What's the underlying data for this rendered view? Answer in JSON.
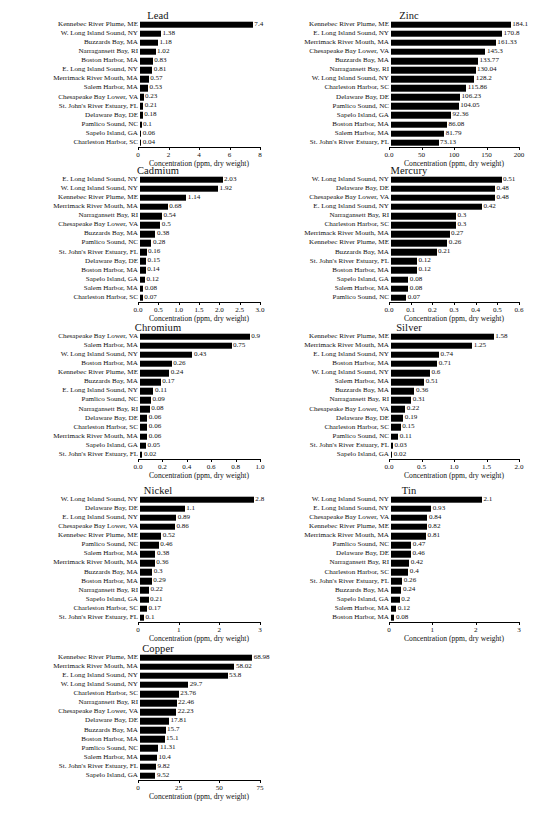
{
  "figure": {
    "axis_label": "Concentration (ppm, dry weight)",
    "bar_color": "#000000",
    "background": "#ffffff"
  },
  "chart_data": [
    {
      "id": "lead",
      "type": "bar",
      "orientation": "horizontal",
      "title": "Lead",
      "xlabel": "Concentration (ppm, dry weight)",
      "ylabel": "",
      "xlim": [
        0,
        8
      ],
      "ticks": [
        0,
        2,
        4,
        6,
        8
      ],
      "tick_labels": [
        "0",
        "2",
        "4",
        "6",
        "8"
      ],
      "grid": false,
      "legend": "none",
      "categories": [
        "Kennebec River Plume, ME",
        "W. Long Island Sound, NY",
        "Buzzards Bay, MA",
        "Narragansett Bay, RI",
        "Boston Harbor, MA",
        "E. Long Island Sound, NY",
        "Merrimack River Mouth, MA",
        "Salem Harbor, MA",
        "Chesapeake Bay Lower, VA",
        "St. John's River Estuary, FL",
        "Delaware Bay, DE",
        "Pamlico Sound, NC",
        "Sapelo Island, GA",
        "Charleston Harbor, SC"
      ],
      "values": [
        7.4,
        1.38,
        1.18,
        1.02,
        0.83,
        0.81,
        0.57,
        0.53,
        0.23,
        0.21,
        0.18,
        0.1,
        0.06,
        0.04
      ],
      "value_labels": [
        "7.4",
        "1.38",
        "1.18",
        "1.02",
        "0.83",
        "0.81",
        "0.57",
        "0.53",
        "0.23",
        "0.21",
        "0.18",
        "0.1",
        "0.06",
        "0.04"
      ]
    },
    {
      "id": "zinc",
      "type": "bar",
      "orientation": "horizontal",
      "title": "Zinc",
      "xlabel": "Concentration (ppm, dry weight)",
      "ylabel": "",
      "xlim": [
        0,
        200
      ],
      "ticks": [
        0,
        50,
        100,
        150,
        200
      ],
      "tick_labels": [
        "0.0",
        "50",
        "100",
        "150",
        "200"
      ],
      "grid": false,
      "legend": "none",
      "categories": [
        "Kennebec River Plume, ME",
        "E. Long Island Sound, NY",
        "Merrimack River Mouth, MA",
        "Chesapeake Bay Lower, VA",
        "Buzzards Bay, MA",
        "Narragansett Bay, RI",
        "W. Long Island Sound, NY",
        "Charleston Harbor, SC",
        "Delaware Bay, DE",
        "Pamlico Sound, NC",
        "Sapelo Island, GA",
        "Boston Harbor, MA",
        "Salem Harbor, MA",
        "St. John's River Estuary, FL"
      ],
      "values": [
        184.1,
        170.8,
        161.33,
        145.3,
        133.77,
        130.04,
        128.2,
        115.86,
        106.23,
        104.05,
        92.36,
        86.08,
        81.79,
        73.13
      ],
      "value_labels": [
        "184.1",
        "170.8",
        "161.33",
        "145.3",
        "133.77",
        "130.04",
        "128.2",
        "115.86",
        "106.23",
        "104.05",
        "92.36",
        "86.08",
        "81.79",
        "73.13"
      ]
    },
    {
      "id": "cadmium",
      "type": "bar",
      "orientation": "horizontal",
      "title": "Cadmium",
      "xlabel": "Concentration (ppm, dry weight)",
      "ylabel": "",
      "xlim": [
        0,
        3.0
      ],
      "ticks": [
        0,
        0.5,
        1.0,
        1.5,
        2.0,
        2.5,
        3.0
      ],
      "tick_labels": [
        "0.0",
        "0.5",
        "1.0",
        "1.5",
        "2.0",
        "2.5",
        "3.0"
      ],
      "grid": false,
      "legend": "none",
      "categories": [
        "E. Long Island Sound, NY",
        "W. Long Island Sound, NY",
        "Kennebec River Plume, ME",
        "Merrimack River Mouth, MA",
        "Narragansett Bay, RI",
        "Chesapeake Bay Lower, VA",
        "Buzzards Bay, MA",
        "Pamlico Sound, NC",
        "St. John's River Estuary, FL",
        "Delaware Bay, DE",
        "Boston Harbor, MA",
        "Sapelo Island, GA",
        "Salem Harbor, MA",
        "Charleston Harbor, SC"
      ],
      "values": [
        2.03,
        1.92,
        1.14,
        0.68,
        0.54,
        0.5,
        0.38,
        0.28,
        0.16,
        0.15,
        0.14,
        0.12,
        0.08,
        0.07
      ],
      "value_labels": [
        "2.03",
        "1.92",
        "1.14",
        "0.68",
        "0.54",
        "0.5",
        "0.38",
        "0.28",
        "0.16",
        "0.15",
        "0.14",
        "0.12",
        "0.08",
        "0.07"
      ]
    },
    {
      "id": "mercury",
      "type": "bar",
      "orientation": "horizontal",
      "title": "Mercury",
      "xlabel": "Concentration (ppm, dry weight)",
      "ylabel": "",
      "xlim": [
        0,
        0.6
      ],
      "ticks": [
        0,
        0.1,
        0.2,
        0.3,
        0.4,
        0.5,
        0.6
      ],
      "tick_labels": [
        "0.0",
        "0.1",
        "0.2",
        "0.3",
        "0.4",
        "0.5",
        "0.6"
      ],
      "grid": false,
      "legend": "none",
      "categories": [
        "W. Long Island Sound, NY",
        "Delaware Bay, DE",
        "Chesapeake Bay Lower, VA",
        "E. Long Island Sound, NY",
        "Narragansett Bay, RI",
        "Charleston Harbor, SC",
        "Merrimack River Mouth, MA",
        "Kennebec River Plume, ME",
        "Buzzards Bay, MA",
        "St. John's River Estuary, FL",
        "Boston Harbor, MA",
        "Sapelo Island, GA",
        "Salem Harbor, MA",
        "Pamlico Sound, NC"
      ],
      "values": [
        0.51,
        0.48,
        0.48,
        0.42,
        0.3,
        0.3,
        0.27,
        0.26,
        0.21,
        0.12,
        0.12,
        0.08,
        0.08,
        0.07
      ],
      "value_labels": [
        "0.51",
        "0.48",
        "0.48",
        "0.42",
        "0.3",
        "0.3",
        "0.27",
        "0.26",
        "0.21",
        "0.12",
        "0.12",
        "0.08",
        "0.08",
        "0.07"
      ]
    },
    {
      "id": "chromium",
      "type": "bar",
      "orientation": "horizontal",
      "title": "Chromium",
      "xlabel": "Concentration (ppm, dry weight)",
      "ylabel": "",
      "xlim": [
        0,
        1.0
      ],
      "ticks": [
        0,
        0.2,
        0.4,
        0.6,
        0.8,
        1.0
      ],
      "tick_labels": [
        "0.0",
        "0.2",
        "0.4",
        "0.6",
        "0.8",
        "1.0"
      ],
      "grid": false,
      "legend": "none",
      "categories": [
        "Chesapeake Bay Lower, VA",
        "Salem Harbor, MA",
        "W. Long Island Sound, NY",
        "Boston Harbor, MA",
        "Kennebec River Plume, ME",
        "Buzzards Bay, MA",
        "E. Long Island Sound, NY",
        "Pamlico Sound, NC",
        "Narragansett Bay, RI",
        "Delaware Bay, DE",
        "Charleston Harbor, SC",
        "Merrimack River Mouth, MA",
        "Sapelo Island, GA",
        "St. John's River Estuary, FL"
      ],
      "values": [
        0.9,
        0.75,
        0.43,
        0.26,
        0.24,
        0.17,
        0.11,
        0.09,
        0.08,
        0.06,
        0.06,
        0.06,
        0.05,
        0.02
      ],
      "value_labels": [
        "0.9",
        "0.75",
        "0.43",
        "0.26",
        "0.24",
        "0.17",
        "0.11",
        "0.09",
        "0.08",
        "0.06",
        "0.06",
        "0.06",
        "0.05",
        "0.02"
      ]
    },
    {
      "id": "silver",
      "type": "bar",
      "orientation": "horizontal",
      "title": "Silver",
      "xlabel": "Concentration (ppm, dry weight)",
      "ylabel": "",
      "xlim": [
        0,
        2.0
      ],
      "ticks": [
        0,
        0.5,
        1.0,
        1.5,
        2.0
      ],
      "tick_labels": [
        "0.0",
        "0.5",
        "1.0",
        "1.5",
        "2.0"
      ],
      "grid": false,
      "legend": "none",
      "categories": [
        "Kennebec River Plume, ME",
        "Merrimack River Mouth, MA",
        "E. Long Island Sound, NY",
        "Boston Harbor, MA",
        "W. Long Island Sound, NY",
        "Salem Harbor, MA",
        "Buzzards Bay, MA",
        "Narragansett Bay, RI",
        "Chesapeake Bay Lower, VA",
        "Delaware Bay, DE",
        "Charleston Harbor, SC",
        "Pamlico Sound, NC",
        "St. John's River Estuary, FL",
        "Sapelo Island, GA"
      ],
      "values": [
        1.58,
        1.25,
        0.74,
        0.71,
        0.6,
        0.51,
        0.36,
        0.31,
        0.22,
        0.19,
        0.15,
        0.11,
        0.03,
        0.02
      ],
      "value_labels": [
        "1.58",
        "1.25",
        "0.74",
        "0.71",
        "0.6",
        "0.51",
        "0.36",
        "0.31",
        "0.22",
        "0.19",
        "0.15",
        "0.11",
        "0.03",
        "0.02"
      ]
    },
    {
      "id": "nickel",
      "type": "bar",
      "orientation": "horizontal",
      "title": "Nickel",
      "xlabel": "Concentration (ppm, dry weight)",
      "ylabel": "",
      "xlim": [
        0,
        3
      ],
      "ticks": [
        0,
        1,
        2,
        3
      ],
      "tick_labels": [
        "0",
        "1",
        "2",
        "3"
      ],
      "grid": false,
      "legend": "none",
      "categories": [
        "W. Long Island Sound, NY",
        "Delaware Bay, DE",
        "E. Long Island Sound, NY",
        "Chesapeake Bay Lower, VA",
        "Kennebec River Plume, ME",
        "Pamlico Sound, NC",
        "Salem Harbor, MA",
        "Merrimack River Mouth, MA",
        "Buzzards Bay, MA",
        "Boston Harbor, MA",
        "Narragansett Bay, RI",
        "Sapelo Island, GA",
        "Charleston Harbor, SC",
        "St. John's River Estuary, FL"
      ],
      "values": [
        2.8,
        1.1,
        0.89,
        0.86,
        0.52,
        0.46,
        0.38,
        0.36,
        0.3,
        0.29,
        0.22,
        0.21,
        0.17,
        0.1
      ],
      "value_labels": [
        "2.8",
        "1.1",
        "0.89",
        "0.86",
        "0.52",
        "0.46",
        "0.38",
        "0.36",
        "0.3",
        "0.29",
        "0.22",
        "0.21",
        "0.17",
        "0.1"
      ]
    },
    {
      "id": "tin",
      "type": "bar",
      "orientation": "horizontal",
      "title": "Tin",
      "xlabel": "Concentration (ppm, dry weight)",
      "ylabel": "",
      "xlim": [
        0,
        3
      ],
      "ticks": [
        0,
        1,
        2,
        3
      ],
      "tick_labels": [
        "0",
        "1",
        "2",
        "3"
      ],
      "grid": false,
      "legend": "none",
      "categories": [
        "W. Long Island Sound, NY",
        "E. Long Island Sound, NY",
        "Chesapeake Bay Lower, VA",
        "Kennebec River Plume, ME",
        "Merrimack River Mouth, MA",
        "Pamlico Sound, NC",
        "Delaware Bay, DE",
        "Narragansett Bay, RI",
        "Charleston Harbor, SC",
        "St. John's River Estuary, FL",
        "Buzzards Bay, MA",
        "Sapelo Island, GA",
        "Salem Harbor, MA",
        "Boston Harbor, MA"
      ],
      "values": [
        2.1,
        0.93,
        0.84,
        0.82,
        0.81,
        0.47,
        0.46,
        0.42,
        0.4,
        0.26,
        0.24,
        0.2,
        0.12,
        0.08
      ],
      "value_labels": [
        "2.1",
        "0.93",
        "0.84",
        "0.82",
        "0.81",
        "0.47",
        "0.46",
        "0.42",
        "0.4",
        "0.26",
        "0.24",
        "0.2",
        "0.12",
        "0.08"
      ]
    },
    {
      "id": "copper",
      "type": "bar",
      "orientation": "horizontal",
      "title": "Copper",
      "xlabel": "Concentration (ppm, dry weight)",
      "ylabel": "",
      "xlim": [
        0,
        75
      ],
      "ticks": [
        0,
        25,
        50,
        75
      ],
      "tick_labels": [
        "0",
        "25",
        "50",
        "75"
      ],
      "grid": false,
      "legend": "none",
      "categories": [
        "Kennebec River Plume, ME",
        "Merrimack River Mouth, MA",
        "E. Long Island Sound, NY",
        "W. Long Island Sound, NY",
        "Charleston Harbor, SC",
        "Narragansett Bay, RI",
        "Chesapeake Bay Lower, VA",
        "Delaware Bay, DE",
        "Buzzards Bay, MA",
        "Boston Harbor, MA",
        "Pamlico Sound, NC",
        "Salem Harbor, MA",
        "St. John's River Estuary, FL",
        "Sapelo Island, GA"
      ],
      "values": [
        68.98,
        58.02,
        53.8,
        29.7,
        23.76,
        22.46,
        22.23,
        17.81,
        15.7,
        15.1,
        11.31,
        10.4,
        9.82,
        9.52
      ],
      "value_labels": [
        "68.98",
        "58.02",
        "53.8",
        "29.7",
        "23.76",
        "22.46",
        "22.23",
        "17.81",
        "15.7",
        "15.1",
        "11.31",
        "10.4",
        "9.82",
        "9.52"
      ]
    }
  ],
  "layout": {
    "panels": [
      {
        "id": "lead",
        "left": 2,
        "top": 10,
        "width": 268,
        "labelw": 136,
        "plotw": 122
      },
      {
        "id": "zinc",
        "left": 273,
        "top": 10,
        "width": 268,
        "labelw": 116,
        "plotw": 130
      },
      {
        "id": "cadmium",
        "left": 2,
        "top": 165,
        "width": 268,
        "labelw": 136,
        "plotw": 122
      },
      {
        "id": "mercury",
        "left": 273,
        "top": 165,
        "width": 268,
        "labelw": 116,
        "plotw": 130
      },
      {
        "id": "chromium",
        "left": 2,
        "top": 322,
        "width": 268,
        "labelw": 136,
        "plotw": 122
      },
      {
        "id": "silver",
        "left": 273,
        "top": 322,
        "width": 268,
        "labelw": 116,
        "plotw": 130
      },
      {
        "id": "nickel",
        "left": 2,
        "top": 485,
        "width": 268,
        "labelw": 136,
        "plotw": 122
      },
      {
        "id": "tin",
        "left": 273,
        "top": 485,
        "width": 268,
        "labelw": 116,
        "plotw": 130
      },
      {
        "id": "copper",
        "left": 2,
        "top": 643,
        "width": 268,
        "labelw": 136,
        "plotw": 122
      }
    ],
    "row_height": 9.1,
    "bar_height": 6.6
  }
}
